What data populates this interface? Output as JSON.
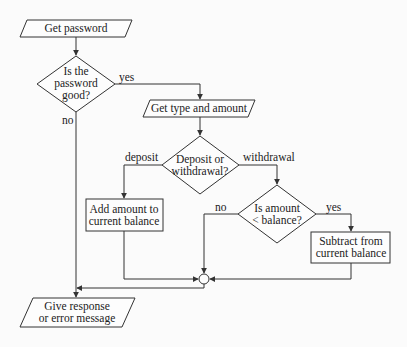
{
  "flowchart": {
    "nodes": {
      "get_password": {
        "type": "input-output",
        "lines": [
          "Get password"
        ]
      },
      "password_good": {
        "type": "decision",
        "lines": [
          "Is the",
          "password",
          "good?"
        ]
      },
      "get_type_amount": {
        "type": "input-output",
        "lines": [
          "Get type and amount"
        ]
      },
      "deposit_or_withdrawal": {
        "type": "decision",
        "lines": [
          "Deposit or",
          "withdrawal?"
        ]
      },
      "add_amount": {
        "type": "process",
        "lines": [
          "Add amount to",
          "current balance"
        ]
      },
      "amount_lt_balance": {
        "type": "decision",
        "lines": [
          "Is amount",
          "< balance?"
        ]
      },
      "subtract": {
        "type": "process",
        "lines": [
          "Subtract from",
          "current balance"
        ]
      },
      "merge": {
        "type": "connector",
        "lines": []
      },
      "give_response": {
        "type": "input-output",
        "lines": [
          "Give response",
          "or error message"
        ]
      }
    },
    "edge_labels": {
      "password_yes": "yes",
      "password_no": "no",
      "deposit": "deposit",
      "withdrawal": "withdrawal",
      "balance_no": "no",
      "balance_yes": "yes"
    },
    "edges": [
      {
        "from": "get_password",
        "to": "password_good",
        "label": ""
      },
      {
        "from": "password_good",
        "to": "get_type_amount",
        "label": "yes"
      },
      {
        "from": "password_good",
        "to": "give_response",
        "label": "no"
      },
      {
        "from": "get_type_amount",
        "to": "deposit_or_withdrawal",
        "label": ""
      },
      {
        "from": "deposit_or_withdrawal",
        "to": "add_amount",
        "label": "deposit"
      },
      {
        "from": "deposit_or_withdrawal",
        "to": "amount_lt_balance",
        "label": "withdrawal"
      },
      {
        "from": "amount_lt_balance",
        "to": "merge",
        "label": "no"
      },
      {
        "from": "amount_lt_balance",
        "to": "subtract",
        "label": "yes"
      },
      {
        "from": "add_amount",
        "to": "merge",
        "label": ""
      },
      {
        "from": "subtract",
        "to": "merge",
        "label": ""
      },
      {
        "from": "merge",
        "to": "give_response",
        "label": ""
      }
    ]
  }
}
